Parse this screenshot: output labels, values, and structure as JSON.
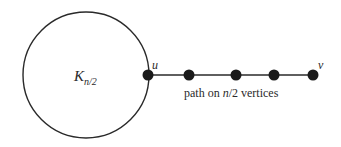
{
  "diagram": {
    "clique_label": {
      "base": "K",
      "subscript": "n/2"
    },
    "vertex_u_label": "u",
    "vertex_v_label": "v",
    "path_label_parts": {
      "pre": "path on ",
      "var": "n",
      "post": "/2 vertices"
    },
    "path_vertex_count_shown": 5,
    "colors": {
      "stroke": "#2a2a2a",
      "vertex": "#1a1a1a"
    }
  }
}
